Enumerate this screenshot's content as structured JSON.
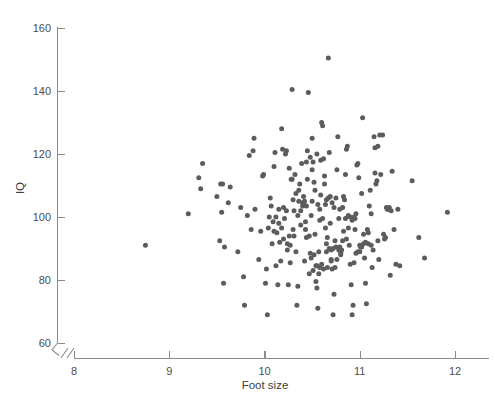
{
  "chart_data": {
    "type": "scatter",
    "title": "",
    "xlabel": "Foot size",
    "ylabel": "IQ",
    "xlim": [
      7.78,
      12.22
    ],
    "ylim": [
      58,
      164
    ],
    "xticks": [
      8,
      9,
      10,
      11,
      12
    ],
    "xtick_labels": [
      "8",
      "9",
      "10",
      "11",
      "12"
    ],
    "yticks": [
      60,
      80,
      100,
      120,
      140,
      160
    ],
    "ytick_labels": [
      "60",
      "80",
      "100",
      "120",
      "140",
      "160"
    ],
    "grid": false,
    "legend": null,
    "axis_break": {
      "present": true,
      "location": "origin",
      "style": "double-slash"
    },
    "marker": {
      "shape": "circle",
      "color": "#5c5c5c",
      "size_px": 5.0
    },
    "n_points": 238,
    "points": [
      [
        8.75,
        91.0
      ],
      [
        9.2,
        101.0
      ],
      [
        9.31,
        112.5
      ],
      [
        9.33,
        109.0
      ],
      [
        9.35,
        117.0
      ],
      [
        9.5,
        106.5
      ],
      [
        9.53,
        92.5
      ],
      [
        9.54,
        110.5
      ],
      [
        9.55,
        101.5
      ],
      [
        9.56,
        110.5
      ],
      [
        9.57,
        79.0
      ],
      [
        9.58,
        90.5
      ],
      [
        9.62,
        104.5
      ],
      [
        9.64,
        109.5
      ],
      [
        9.72,
        89.0
      ],
      [
        9.75,
        103.0
      ],
      [
        9.78,
        81.0
      ],
      [
        9.79,
        72.0
      ],
      [
        9.82,
        100.5
      ],
      [
        9.84,
        119.5
      ],
      [
        9.86,
        96.0
      ],
      [
        9.88,
        121.0
      ],
      [
        9.89,
        125.0
      ],
      [
        9.9,
        102.5
      ],
      [
        9.94,
        86.5
      ],
      [
        9.96,
        95.5
      ],
      [
        9.98,
        113.0
      ],
      [
        9.99,
        113.5
      ],
      [
        10.01,
        79.0
      ],
      [
        10.02,
        83.5
      ],
      [
        10.03,
        69.0
      ],
      [
        10.04,
        96.5
      ],
      [
        10.05,
        100.0
      ],
      [
        10.06,
        106.0
      ],
      [
        10.07,
        103.5
      ],
      [
        10.08,
        91.5
      ],
      [
        10.09,
        98.5
      ],
      [
        10.1,
        116.0
      ],
      [
        10.11,
        120.5
      ],
      [
        10.12,
        84.5
      ],
      [
        10.13,
        95.0
      ],
      [
        10.14,
        78.5
      ],
      [
        10.15,
        102.5
      ],
      [
        10.16,
        92.0
      ],
      [
        10.17,
        86.0
      ],
      [
        10.18,
        128.0
      ],
      [
        10.19,
        121.5
      ],
      [
        10.2,
        103.0
      ],
      [
        10.21,
        99.5
      ],
      [
        10.22,
        120.0
      ],
      [
        10.23,
        121.0
      ],
      [
        10.24,
        91.5
      ],
      [
        10.25,
        78.5
      ],
      [
        10.26,
        94.0
      ],
      [
        10.27,
        85.5
      ],
      [
        10.28,
        112.0
      ],
      [
        10.29,
        140.5
      ],
      [
        10.3,
        105.5
      ],
      [
        10.31,
        102.0
      ],
      [
        10.32,
        113.5
      ],
      [
        10.33,
        89.0
      ],
      [
        10.34,
        72.0
      ],
      [
        10.35,
        78.0
      ],
      [
        10.36,
        108.5
      ],
      [
        10.37,
        110.5
      ],
      [
        10.38,
        102.0
      ],
      [
        10.39,
        117.0
      ],
      [
        10.4,
        103.5
      ],
      [
        10.41,
        104.5
      ],
      [
        10.42,
        86.0
      ],
      [
        10.43,
        96.0
      ],
      [
        10.44,
        93.5
      ],
      [
        10.45,
        121.0
      ],
      [
        10.46,
        139.5
      ],
      [
        10.47,
        82.0
      ],
      [
        10.48,
        88.5
      ],
      [
        10.49,
        100.5
      ],
      [
        10.5,
        105.0
      ],
      [
        10.51,
        117.5
      ],
      [
        10.52,
        111.0
      ],
      [
        10.53,
        94.5
      ],
      [
        10.54,
        84.5
      ],
      [
        10.55,
        77.5
      ],
      [
        10.56,
        71.0
      ],
      [
        10.57,
        89.0
      ],
      [
        10.58,
        99.0
      ],
      [
        10.59,
        107.0
      ],
      [
        10.6,
        130.0
      ],
      [
        10.61,
        129.0
      ],
      [
        10.62,
        118.5
      ],
      [
        10.63,
        113.0
      ],
      [
        10.64,
        104.0
      ],
      [
        10.65,
        91.5
      ],
      [
        10.66,
        84.0
      ],
      [
        10.67,
        150.5
      ],
      [
        10.68,
        120.5
      ],
      [
        10.69,
        98.0
      ],
      [
        10.7,
        86.0
      ],
      [
        10.71,
        83.5
      ],
      [
        10.72,
        69.0
      ],
      [
        10.73,
        75.5
      ],
      [
        10.74,
        92.5
      ],
      [
        10.75,
        106.0
      ],
      [
        10.76,
        115.0
      ],
      [
        10.77,
        125.5
      ],
      [
        10.78,
        99.5
      ],
      [
        10.79,
        90.5
      ],
      [
        10.8,
        88.5
      ],
      [
        10.81,
        89.5
      ],
      [
        10.82,
        103.0
      ],
      [
        10.83,
        106.5
      ],
      [
        10.84,
        105.5
      ],
      [
        10.85,
        113.5
      ],
      [
        10.86,
        121.5
      ],
      [
        10.87,
        122.5
      ],
      [
        10.88,
        96.5
      ],
      [
        10.89,
        91.0
      ],
      [
        10.9,
        85.0
      ],
      [
        10.91,
        78.5
      ],
      [
        10.92,
        69.0
      ],
      [
        10.93,
        72.0
      ],
      [
        10.94,
        100.0
      ],
      [
        10.95,
        99.5
      ],
      [
        10.96,
        101.0
      ],
      [
        10.97,
        116.5
      ],
      [
        10.98,
        117.0
      ],
      [
        10.99,
        112.5
      ],
      [
        11.0,
        89.0
      ],
      [
        11.01,
        90.5
      ],
      [
        11.02,
        107.5
      ],
      [
        11.03,
        131.5
      ],
      [
        11.04,
        94.5
      ],
      [
        11.05,
        87.0
      ],
      [
        11.06,
        79.0
      ],
      [
        11.07,
        72.5
      ],
      [
        11.08,
        96.0
      ],
      [
        11.09,
        91.5
      ],
      [
        11.1,
        103.5
      ],
      [
        11.11,
        108.5
      ],
      [
        11.12,
        101.0
      ],
      [
        11.13,
        84.0
      ],
      [
        11.14,
        89.5
      ],
      [
        11.15,
        125.5
      ],
      [
        11.16,
        122.0
      ],
      [
        11.17,
        110.5
      ],
      [
        11.18,
        111.5
      ],
      [
        11.19,
        92.5
      ],
      [
        11.2,
        86.5
      ],
      [
        11.22,
        113.5
      ],
      [
        11.24,
        126.0
      ],
      [
        11.25,
        94.5
      ],
      [
        11.26,
        93.0
      ],
      [
        11.27,
        93.5
      ],
      [
        11.28,
        103.0
      ],
      [
        11.3,
        102.5
      ],
      [
        11.32,
        81.5
      ],
      [
        11.34,
        114.5
      ],
      [
        11.36,
        96.0
      ],
      [
        11.38,
        85.0
      ],
      [
        11.4,
        102.5
      ],
      [
        11.55,
        111.5
      ],
      [
        11.62,
        93.5
      ],
      [
        11.68,
        87.0
      ],
      [
        11.92,
        101.5
      ],
      [
        10.1,
        95.5
      ],
      [
        10.23,
        102.0
      ],
      [
        10.3,
        96.0
      ],
      [
        10.35,
        100.5
      ],
      [
        10.41,
        106.5
      ],
      [
        10.44,
        103.5
      ],
      [
        10.47,
        94.0
      ],
      [
        10.52,
        88.0
      ],
      [
        10.55,
        84.5
      ],
      [
        10.58,
        84.0
      ],
      [
        10.6,
        85.0
      ],
      [
        10.62,
        83.5
      ],
      [
        10.65,
        89.0
      ],
      [
        10.7,
        89.5
      ],
      [
        10.72,
        90.0
      ],
      [
        10.75,
        90.5
      ],
      [
        10.78,
        89.5
      ],
      [
        10.8,
        88.0
      ],
      [
        10.82,
        92.5
      ],
      [
        10.85,
        99.5
      ],
      [
        10.88,
        100.5
      ],
      [
        10.9,
        100.0
      ],
      [
        10.92,
        99.0
      ],
      [
        10.95,
        96.0
      ],
      [
        11.0,
        91.0
      ],
      [
        11.02,
        90.5
      ],
      [
        10.4,
        104.5
      ],
      [
        10.42,
        105.0
      ],
      [
        10.36,
        105.0
      ],
      [
        10.33,
        107.5
      ],
      [
        10.29,
        112.0
      ],
      [
        10.26,
        115.5
      ],
      [
        10.44,
        117.5
      ],
      [
        10.48,
        119.0
      ],
      [
        10.5,
        115.0
      ],
      [
        10.53,
        108.5
      ],
      [
        10.56,
        104.0
      ],
      [
        10.58,
        102.5
      ],
      [
        10.61,
        99.5
      ],
      [
        10.64,
        96.5
      ],
      [
        10.66,
        93.5
      ],
      [
        10.68,
        90.0
      ],
      [
        10.7,
        86.5
      ],
      [
        10.74,
        84.0
      ],
      [
        10.76,
        86.5
      ],
      [
        10.12,
        100.0
      ],
      [
        10.15,
        98.0
      ],
      [
        10.18,
        96.5
      ],
      [
        10.2,
        93.0
      ],
      [
        10.24,
        89.5
      ],
      [
        10.27,
        91.0
      ],
      [
        10.31,
        94.0
      ],
      [
        10.65,
        105.5
      ],
      [
        10.67,
        106.0
      ],
      [
        10.69,
        106.5
      ],
      [
        10.71,
        104.5
      ],
      [
        10.73,
        103.0
      ],
      [
        10.79,
        102.5
      ],
      [
        10.83,
        95.5
      ],
      [
        10.86,
        93.0
      ],
      [
        10.63,
        110.5
      ],
      [
        10.59,
        118.0
      ],
      [
        10.55,
        120.0
      ],
      [
        10.5,
        125.0
      ],
      [
        10.45,
        112.0
      ],
      [
        10.38,
        97.5
      ],
      [
        10.43,
        98.5
      ],
      [
        10.49,
        87.0
      ],
      [
        10.51,
        83.0
      ],
      [
        10.54,
        79.5
      ],
      [
        10.57,
        82.0
      ],
      [
        10.94,
        85.5
      ],
      [
        10.96,
        88.5
      ],
      [
        10.98,
        89.0
      ],
      [
        11.04,
        91.5
      ],
      [
        11.06,
        92.0
      ],
      [
        11.09,
        95.0
      ],
      [
        11.12,
        91.0
      ],
      [
        11.16,
        114.0
      ],
      [
        11.19,
        122.5
      ],
      [
        11.21,
        126.0
      ],
      [
        11.29,
        102.5
      ],
      [
        11.31,
        103.0
      ],
      [
        11.33,
        102.0
      ],
      [
        11.42,
        84.5
      ]
    ]
  }
}
